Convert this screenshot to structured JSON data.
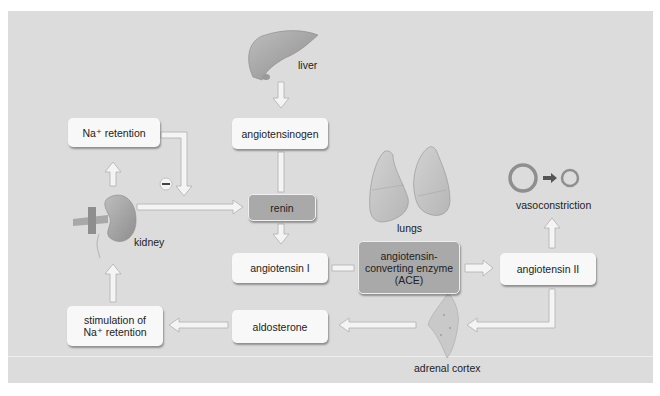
{
  "diagram": {
    "colors": {
      "background": "#dcdcdc",
      "box": "#f8f8f8",
      "enzyme_box": "#a9a9a9",
      "organ": "#a0a0a0",
      "arrow_fill": "#f4f4f4",
      "arrow_stroke": "#b0b0b0"
    },
    "organs": {
      "liver": "liver",
      "kidney": "kidney",
      "lungs": "lungs",
      "adrenal": "adrenal cortex",
      "vessel": "vasoconstriction"
    },
    "boxes": {
      "na_retention": "Na⁺ retention",
      "angiotensinogen": "angiotensinogen",
      "renin": "renin",
      "angiotensin_1": "angiotensin I",
      "ace_line1": "angiotensin-",
      "ace_line2": "converting enzyme",
      "ace_line3": "(ACE)",
      "angiotensin_2": "angiotensin II",
      "aldosterone": "aldosterone",
      "stimulation_line1": "stimulation of",
      "stimulation_line2": "Na⁺ retention"
    },
    "inhibition_symbol": "−",
    "flows": [
      {
        "from": "liver",
        "to": "angiotensinogen"
      },
      {
        "from": "angiotensinogen",
        "to": "renin"
      },
      {
        "from": "kidney",
        "to": "renin"
      },
      {
        "from": "kidney",
        "to": "Na⁺ retention"
      },
      {
        "from": "Na⁺ retention",
        "to": "renin",
        "effect": "inhibit"
      },
      {
        "from": "renin",
        "to": "angiotensin I"
      },
      {
        "from": "angiotensin I",
        "to": "ACE"
      },
      {
        "from": "ACE",
        "to": "angiotensin II"
      },
      {
        "from": "angiotensin II",
        "to": "vasoconstriction"
      },
      {
        "from": "angiotensin II",
        "to": "adrenal cortex"
      },
      {
        "from": "adrenal cortex",
        "to": "aldosterone"
      },
      {
        "from": "aldosterone",
        "to": "stimulation of Na⁺ retention"
      },
      {
        "from": "stimulation of Na⁺ retention",
        "to": "kidney"
      }
    ]
  }
}
